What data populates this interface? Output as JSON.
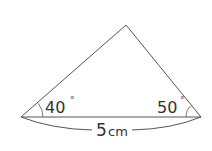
{
  "diagram": {
    "type": "triangle",
    "vertices": {
      "left": [
        21,
        117
      ],
      "right": [
        201,
        117
      ],
      "apex": [
        126,
        25
      ]
    },
    "angles": {
      "left": {
        "label": "40",
        "degree_symbol": "°"
      },
      "right": {
        "label": "50",
        "degree_symbol": "°"
      }
    },
    "base_length": {
      "value": "5",
      "unit": "cm"
    },
    "stroke_color": "#555555"
  }
}
